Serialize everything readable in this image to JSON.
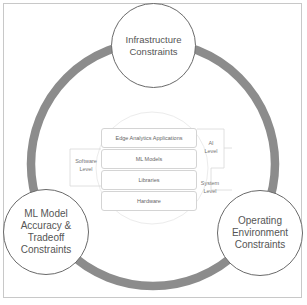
{
  "diagram": {
    "constraints": [
      {
        "id": "infrastructure",
        "label": "Infrastructure\nConstraints",
        "position": "top"
      },
      {
        "id": "ml-model",
        "label": "ML Model\nAccuracy &\nTradeoff\nConstraints",
        "position": "bottom-left"
      },
      {
        "id": "operating-environment",
        "label": "Operating\nEnvironment\nConstraints",
        "position": "bottom-right"
      }
    ],
    "stack_layers": [
      {
        "label": "Edge Analytics Applications"
      },
      {
        "label": "ML Models"
      },
      {
        "label": "Libraries"
      },
      {
        "label": "Hardware"
      }
    ],
    "level_labels": {
      "software": "Software\nLevel",
      "ai": "AI\nLevel",
      "system": "System\nLevel"
    },
    "colors": {
      "ring": "#8c8c8c",
      "node_border": "#6a6a6a",
      "layer_border": "#d4d4d4",
      "inner_circle": "#ececec"
    }
  }
}
